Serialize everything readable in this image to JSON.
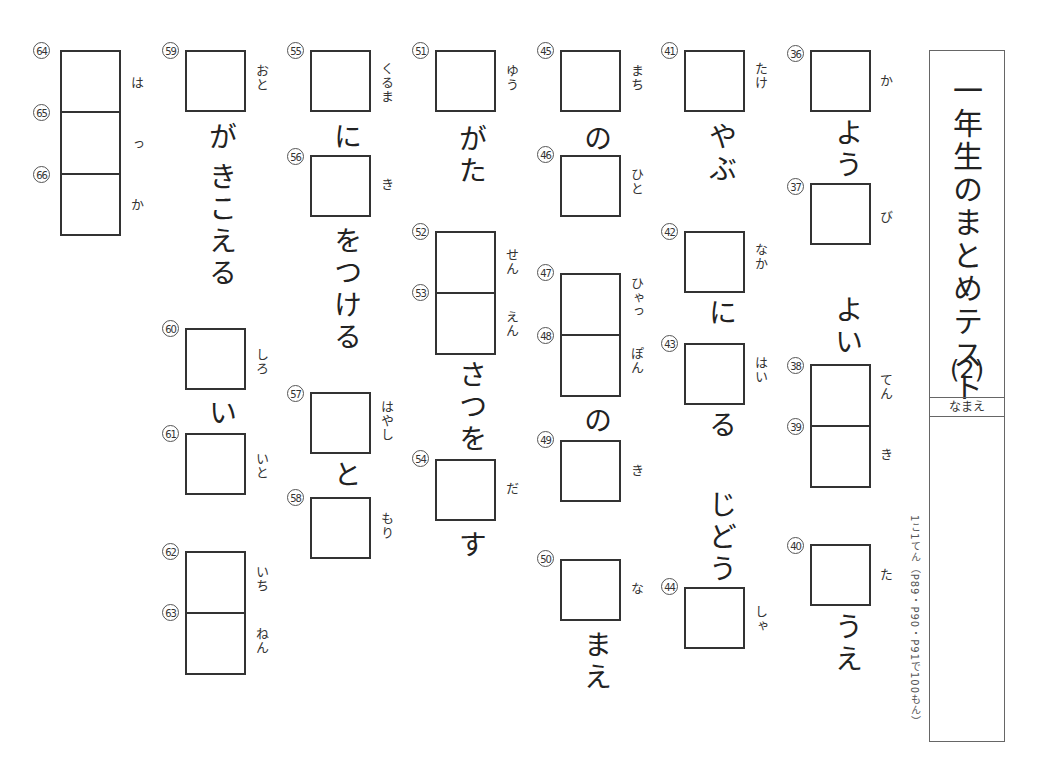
{
  "worksheet": {
    "title": "一年生のまとめテスト",
    "title_number": "(2)",
    "name_label": "なまえ",
    "scoring_note": "1こ1てん（P89・P90・P91で100もん）"
  },
  "columns": [
    {
      "items": [
        {
          "nums": [
            "36"
          ],
          "ruby": "か",
          "after": "よう"
        },
        {
          "nums": [
            "37"
          ],
          "ruby": "び",
          "before": "",
          "after": ""
        },
        {
          "nums": [
            "38",
            "39"
          ],
          "ruby": [
            "てん",
            "き"
          ],
          "before": "よい"
        },
        {
          "nums": [
            "40"
          ],
          "ruby": "た",
          "after": "うえ"
        }
      ]
    },
    {
      "items": [
        {
          "nums": [
            "41"
          ],
          "ruby": "たけ",
          "after": "やぶ"
        },
        {
          "nums": [
            "42"
          ],
          "ruby": "なか",
          "after": "に"
        },
        {
          "nums": [
            "43"
          ],
          "ruby": "はい",
          "after": "る"
        },
        {
          "nums": [
            "44"
          ],
          "ruby": "しゃ",
          "before": "じどう"
        }
      ]
    },
    {
      "items": [
        {
          "nums": [
            "45"
          ],
          "ruby": "まち",
          "after": "の"
        },
        {
          "nums": [
            "46"
          ],
          "ruby": "ひと"
        },
        {
          "nums": [
            "47",
            "48"
          ],
          "ruby": [
            "ひゃっ",
            "ぽん"
          ],
          "after": "の"
        },
        {
          "nums": [
            "49"
          ],
          "ruby": "き"
        },
        {
          "nums": [
            "50"
          ],
          "ruby": "な",
          "after": "まえ"
        }
      ]
    },
    {
      "items": [
        {
          "nums": [
            "51"
          ],
          "ruby": "ゆう",
          "after": "がた"
        },
        {
          "nums": [
            "52",
            "53"
          ],
          "ruby": [
            "せん",
            "えん"
          ],
          "after": "さつを"
        },
        {
          "nums": [
            "54"
          ],
          "ruby": "だ",
          "after": "す"
        }
      ]
    },
    {
      "items": [
        {
          "nums": [
            "55"
          ],
          "ruby": "くるま",
          "after": "に"
        },
        {
          "nums": [
            "56"
          ],
          "ruby": "き",
          "after": "をつける"
        },
        {
          "nums": [
            "57"
          ],
          "ruby": "はやし",
          "after": "と"
        },
        {
          "nums": [
            "58"
          ],
          "ruby": "もり"
        }
      ]
    },
    {
      "items": [
        {
          "nums": [
            "59"
          ],
          "ruby": "おと",
          "after": "が きこえる"
        },
        {
          "nums": [
            "60"
          ],
          "ruby": "しろ",
          "after": "い"
        },
        {
          "nums": [
            "61"
          ],
          "ruby": "いと"
        },
        {
          "nums": [
            "62",
            "63"
          ],
          "ruby": [
            "いち",
            "ねん"
          ]
        }
      ]
    },
    {
      "items": [
        {
          "nums": [
            "64",
            "65",
            "66"
          ],
          "ruby": [
            "は",
            "っ",
            "か"
          ]
        }
      ]
    }
  ],
  "labels": {
    "n36": "㊱",
    "n37": "㊲",
    "n38": "㊳",
    "n39": "㊴",
    "n40": "㊵",
    "n41": "㊶",
    "n42": "㊷",
    "n43": "㊸",
    "n44": "㊹",
    "n45": "㊺",
    "n46": "㊻",
    "n47": "㊼",
    "n48": "㊽",
    "n49": "㊾",
    "n50": "㊿",
    "n51": "51",
    "n52": "52",
    "n53": "53",
    "n54": "54",
    "n55": "55",
    "n56": "56",
    "n57": "57",
    "n58": "58",
    "n59": "59",
    "n60": "60",
    "n61": "61",
    "n62": "62",
    "n63": "63",
    "n64": "64",
    "n65": "65",
    "n66": "66"
  },
  "text": {
    "c1_you": "よう",
    "c1_yoi": "よい",
    "c1_ue": "うえ",
    "r36": "か",
    "r37": "び",
    "r38": "てん",
    "r39": "き",
    "r40": "た",
    "c2_yabu": "やぶ",
    "c2_ni": "に",
    "c2_ru": "る",
    "c2_jidou": "じどう",
    "r41": "たけ",
    "r42": "なか",
    "r43": "はい",
    "r44": "しゃ",
    "c3_no1": "の",
    "c3_no2": "の",
    "c3_mae": "まえ",
    "r45": "まち",
    "r46": "ひと",
    "r47": "ひゃっ",
    "r48": "ぽん",
    "r49": "き",
    "r50": "な",
    "c4_gata": "がた",
    "c4_satsuwo": "さつを",
    "c4_su": "す",
    "r51": "ゆう",
    "r52": "せん",
    "r53": "えん",
    "r54": "だ",
    "c5_ni": "に",
    "c5_wotsukeru": "をつける",
    "c5_to": "と",
    "r55": "くるま",
    "r56": "き",
    "r57": "はやし",
    "r58": "もり",
    "c6_ga": "が",
    "c6_kikoeru": "きこえる",
    "c6_i": "い",
    "r59": "おと",
    "r60": "しろ",
    "r61": "いと",
    "r62": "いち",
    "r63": "ねん",
    "r64": "は",
    "r65": "っ",
    "r66": "か"
  }
}
